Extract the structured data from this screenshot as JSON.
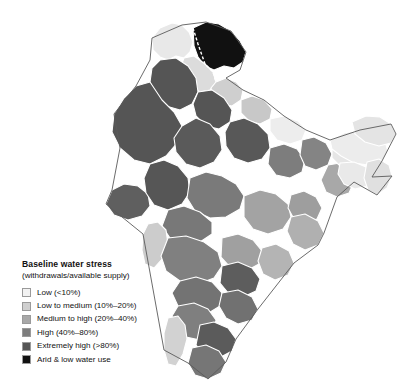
{
  "figure": {
    "background_color": "#ffffff"
  },
  "legend": {
    "title": "Baseline water stress",
    "subtitle": "(withdrawals/available supply)",
    "items": [
      {
        "label": "Low (<10%)",
        "color": "#f2f2f2",
        "key": "low"
      },
      {
        "label": "Low to medium (10%–20%)",
        "color": "#cfcfcf",
        "key": "low-to-medium"
      },
      {
        "label": "Medium to high (20%–40%)",
        "color": "#a8a8a8",
        "key": "medium-to-high"
      },
      {
        "label": "High (40%–80%)",
        "color": "#7d7d7d",
        "key": "high"
      },
      {
        "label": "Extremely high (>80%)",
        "color": "#555555",
        "key": "extremely-high"
      },
      {
        "label": "Arid & low water use",
        "color": "#111111",
        "key": "arid"
      }
    ]
  },
  "map": {
    "outline_color": "#5a5a5a",
    "boundary_color": "#ffffff",
    "regions": [
      {
        "name": "ladakh-upper-indus",
        "stress": "arid",
        "color": "#111111"
      },
      {
        "name": "kashmir-valley",
        "stress": "low",
        "color": "#e8e8e8"
      },
      {
        "name": "himachal-upper-basin",
        "stress": "low-to-medium",
        "color": "#cfcfcf"
      },
      {
        "name": "punjab-plain",
        "stress": "extremely-high",
        "color": "#555555"
      },
      {
        "name": "haryana-upper-yamuna",
        "stress": "extremely-high",
        "color": "#555555"
      },
      {
        "name": "west-rajasthan-thar",
        "stress": "extremely-high",
        "color": "#555555"
      },
      {
        "name": "east-rajasthan",
        "stress": "extremely-high",
        "color": "#5a5a5a"
      },
      {
        "name": "kutch-saurashtra",
        "stress": "extremely-high",
        "color": "#5f5f5f"
      },
      {
        "name": "gujarat-sabarmati",
        "stress": "extremely-high",
        "color": "#565656"
      },
      {
        "name": "upper-ganga",
        "stress": "extremely-high",
        "color": "#585858"
      },
      {
        "name": "middle-ganga",
        "stress": "high",
        "color": "#7d7d7d"
      },
      {
        "name": "lower-ganga-bengal",
        "stress": "medium-to-high",
        "color": "#a8a8a8"
      },
      {
        "name": "uttarakhand-himalaya",
        "stress": "low-to-medium",
        "color": "#c8c8c8"
      },
      {
        "name": "nepal-border-terai",
        "stress": "low",
        "color": "#ededed"
      },
      {
        "name": "bihar-gandak",
        "stress": "high",
        "color": "#848484"
      },
      {
        "name": "chhattisgarh-mahanadi",
        "stress": "medium-to-high",
        "color": "#a3a3a3"
      },
      {
        "name": "odisha-coastal",
        "stress": "medium-to-high",
        "color": "#b0b0b0"
      },
      {
        "name": "jharkhand-subarnarekha",
        "stress": "medium-to-high",
        "color": "#9e9e9e"
      },
      {
        "name": "madhya-pradesh-narmada",
        "stress": "high",
        "color": "#7a7a7a"
      },
      {
        "name": "tapi-basin",
        "stress": "high",
        "color": "#787878"
      },
      {
        "name": "maharashtra-godavari",
        "stress": "high",
        "color": "#808080"
      },
      {
        "name": "upper-godavari",
        "stress": "medium-to-high",
        "color": "#a0a0a0"
      },
      {
        "name": "konkan-coast",
        "stress": "low-to-medium",
        "color": "#cccccc"
      },
      {
        "name": "krishna-basin",
        "stress": "high",
        "color": "#737373"
      },
      {
        "name": "telangana-inner",
        "stress": "extremely-high",
        "color": "#5d5d5d"
      },
      {
        "name": "andhra-coastal",
        "stress": "medium-to-high",
        "color": "#b4b4b4"
      },
      {
        "name": "karnataka-plateau",
        "stress": "high",
        "color": "#7f7f7f"
      },
      {
        "name": "kerala-western-ghats",
        "stress": "low-to-medium",
        "color": "#d2d2d2"
      },
      {
        "name": "cauvery-basin",
        "stress": "extremely-high",
        "color": "#5b5b5b"
      },
      {
        "name": "tamil-nadu-south",
        "stress": "high",
        "color": "#767676"
      },
      {
        "name": "pennar-basin",
        "stress": "high",
        "color": "#717171"
      },
      {
        "name": "assam-brahmaputra",
        "stress": "low",
        "color": "#ececec"
      },
      {
        "name": "arunachal-upper",
        "stress": "low",
        "color": "#e4e4e4"
      },
      {
        "name": "meghalaya-barak",
        "stress": "low",
        "color": "#e9e9e9"
      },
      {
        "name": "manipur-mizoram",
        "stress": "low",
        "color": "#e0e0e0"
      },
      {
        "name": "sikkim-teesta",
        "stress": "low",
        "color": "#e6e6e6"
      }
    ]
  }
}
